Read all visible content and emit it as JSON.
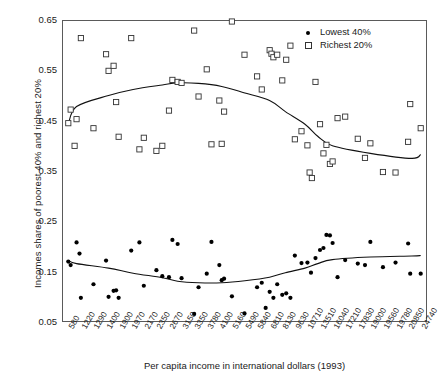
{
  "chart_data": {
    "type": "scatter",
    "title": "",
    "xlabel": "Per capita income in international dollars (1993)",
    "ylabel": "Incomes shares of poorest 40% and richest 20%",
    "grid": false,
    "legend_position": "top-right",
    "ylim": [
      0.05,
      0.65
    ],
    "yticks": [
      0.05,
      0.15,
      0.25,
      0.35,
      0.45,
      0.55,
      0.65
    ],
    "ytick_labels": [
      "0.05",
      "0.15",
      "0.25",
      "0.35",
      "0.45",
      "0.55",
      "0.65"
    ],
    "categories": [
      "580",
      "1220",
      "1290",
      "1400",
      "1900",
      "1970",
      "2170",
      "2350",
      "2670",
      "3150",
      "3350",
      "3780",
      "4100",
      "5160",
      "5490",
      "5840",
      "6810",
      "8130",
      "9630",
      "10710",
      "13510",
      "16040",
      "17210",
      "17830",
      "19000",
      "19560",
      "19780",
      "20850",
      "24740"
    ],
    "series": [
      {
        "name": "Lowest 40%",
        "marker": "filled-circle",
        "color": "#000000",
        "points": [
          [
            580,
            0.17
          ],
          [
            700,
            0.163
          ],
          [
            1000,
            0.208
          ],
          [
            1150,
            0.186
          ],
          [
            1220,
            0.098
          ],
          [
            1290,
            0.125
          ],
          [
            1400,
            0.172
          ],
          [
            1500,
            0.1
          ],
          [
            1700,
            0.112
          ],
          [
            1800,
            0.113
          ],
          [
            1900,
            0.098
          ],
          [
            1970,
            0.192
          ],
          [
            2100,
            0.208
          ],
          [
            2170,
            0.122
          ],
          [
            2350,
            0.153
          ],
          [
            2500,
            0.141
          ],
          [
            2670,
            0.139
          ],
          [
            2800,
            0.213
          ],
          [
            3000,
            0.205
          ],
          [
            3150,
            0.137
          ],
          [
            3350,
            0.066
          ],
          [
            3500,
            0.119
          ],
          [
            3780,
            0.146
          ],
          [
            3900,
            0.209
          ],
          [
            4100,
            0.163
          ],
          [
            4300,
            0.133
          ],
          [
            4500,
            0.136
          ],
          [
            5160,
            0.101
          ],
          [
            5490,
            0.067
          ],
          [
            5840,
            0.119
          ],
          [
            6200,
            0.128
          ],
          [
            6500,
            0.078
          ],
          [
            6810,
            0.11
          ],
          [
            7200,
            0.098
          ],
          [
            7600,
            0.125
          ],
          [
            8130,
            0.104
          ],
          [
            8600,
            0.107
          ],
          [
            9100,
            0.098
          ],
          [
            9630,
            0.182
          ],
          [
            10200,
            0.167
          ],
          [
            10710,
            0.168
          ],
          [
            11500,
            0.148
          ],
          [
            12500,
            0.177
          ],
          [
            13510,
            0.193
          ],
          [
            14200,
            0.197
          ],
          [
            14800,
            0.223
          ],
          [
            15500,
            0.222
          ],
          [
            16040,
            0.207
          ],
          [
            16500,
            0.139
          ],
          [
            17210,
            0.173
          ],
          [
            17830,
            0.166
          ],
          [
            18500,
            0.163
          ],
          [
            19000,
            0.209
          ],
          [
            19560,
            0.159
          ],
          [
            19780,
            0.168
          ],
          [
            20850,
            0.206
          ],
          [
            21500,
            0.146
          ],
          [
            24740,
            0.146
          ]
        ]
      },
      {
        "name": "Richest 20%",
        "marker": "open-square",
        "color": "#333333",
        "points": [
          [
            580,
            0.445
          ],
          [
            700,
            0.472
          ],
          [
            900,
            0.4
          ],
          [
            1000,
            0.453
          ],
          [
            1220,
            0.614
          ],
          [
            1290,
            0.435
          ],
          [
            1400,
            0.582
          ],
          [
            1500,
            0.549
          ],
          [
            1700,
            0.559
          ],
          [
            1800,
            0.487
          ],
          [
            1900,
            0.418
          ],
          [
            1970,
            0.614
          ],
          [
            2100,
            0.393
          ],
          [
            2170,
            0.416
          ],
          [
            2350,
            0.39
          ],
          [
            2500,
            0.4
          ],
          [
            2670,
            0.47
          ],
          [
            2800,
            0.531
          ],
          [
            3000,
            0.527
          ],
          [
            3150,
            0.525
          ],
          [
            3350,
            0.629
          ],
          [
            3500,
            0.498
          ],
          [
            3780,
            0.552
          ],
          [
            3900,
            0.403
          ],
          [
            4100,
            0.49
          ],
          [
            4300,
            0.404
          ],
          [
            4500,
            0.468
          ],
          [
            5160,
            0.647
          ],
          [
            5490,
            0.581
          ],
          [
            5840,
            0.538
          ],
          [
            6200,
            0.512
          ],
          [
            6810,
            0.59
          ],
          [
            7000,
            0.583
          ],
          [
            7200,
            0.576
          ],
          [
            7600,
            0.581
          ],
          [
            8130,
            0.53
          ],
          [
            8600,
            0.571
          ],
          [
            9100,
            0.599
          ],
          [
            9630,
            0.413
          ],
          [
            10200,
            0.429
          ],
          [
            10710,
            0.401
          ],
          [
            11200,
            0.347
          ],
          [
            11700,
            0.336
          ],
          [
            12500,
            0.527
          ],
          [
            13510,
            0.443
          ],
          [
            14200,
            0.385
          ],
          [
            14800,
            0.402
          ],
          [
            15500,
            0.364
          ],
          [
            16040,
            0.369
          ],
          [
            16500,
            0.455
          ],
          [
            17210,
            0.458
          ],
          [
            17830,
            0.414
          ],
          [
            18500,
            0.376
          ],
          [
            19000,
            0.405
          ],
          [
            19560,
            0.348
          ],
          [
            19780,
            0.347
          ],
          [
            20850,
            0.408
          ],
          [
            21500,
            0.483
          ],
          [
            24740,
            0.435
          ]
        ]
      }
    ],
    "trend_lines": [
      {
        "for_series": "Richest 20%",
        "description": "inverted-U smoothed curve peaking near 0.525 at mid incomes",
        "points": [
          [
            580,
            0.443
          ],
          [
            1000,
            0.478
          ],
          [
            1500,
            0.5
          ],
          [
            2000,
            0.512
          ],
          [
            2500,
            0.521
          ],
          [
            3000,
            0.525
          ],
          [
            3500,
            0.524
          ],
          [
            4300,
            0.518
          ],
          [
            5500,
            0.505
          ],
          [
            6800,
            0.49
          ],
          [
            8500,
            0.468
          ],
          [
            10500,
            0.443
          ],
          [
            13000,
            0.419
          ],
          [
            16000,
            0.4
          ],
          [
            19000,
            0.385
          ],
          [
            22000,
            0.375
          ],
          [
            24740,
            0.383
          ]
        ]
      },
      {
        "for_series": "Lowest 40%",
        "description": "shallow U-shaped smoothed curve with minimum near 0.128",
        "points": [
          [
            580,
            0.172
          ],
          [
            1000,
            0.166
          ],
          [
            1500,
            0.157
          ],
          [
            2000,
            0.147
          ],
          [
            2500,
            0.138
          ],
          [
            3000,
            0.131
          ],
          [
            3500,
            0.128
          ],
          [
            4300,
            0.128
          ],
          [
            5500,
            0.132
          ],
          [
            6800,
            0.139
          ],
          [
            8500,
            0.148
          ],
          [
            10500,
            0.157
          ],
          [
            13000,
            0.166
          ],
          [
            16000,
            0.174
          ],
          [
            19000,
            0.179
          ],
          [
            22000,
            0.181
          ],
          [
            24740,
            0.182
          ]
        ]
      }
    ],
    "legend": [
      {
        "label": "Lowest 40%",
        "marker": "filled-circle"
      },
      {
        "label": "Richest 20%",
        "marker": "open-square"
      }
    ]
  }
}
